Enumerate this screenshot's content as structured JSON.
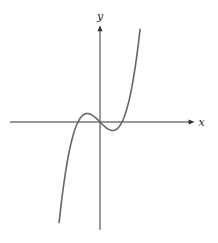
{
  "chart_data": {
    "type": "line",
    "title": "",
    "xlabel": "x",
    "ylabel": "y",
    "function": "y = x^3 - x",
    "xlim": [
      -4.1,
      4.3
    ],
    "ylim": [
      -4.9,
      4.4
    ],
    "grid": false,
    "legend": "none",
    "series": [
      {
        "name": "cubic",
        "x_range": [
          -1.86,
          1.82
        ],
        "x": [
          -1.86,
          -1.5,
          -1.0,
          -0.577,
          0,
          0.577,
          1.0,
          1.5,
          1.82
        ],
        "y": [
          -4.57,
          -1.88,
          0,
          0.385,
          0,
          -0.385,
          0,
          1.88,
          4.21
        ]
      }
    ],
    "annotations": {
      "roots": [
        -1,
        0,
        1
      ],
      "local_max": [
        -0.577,
        0.385
      ],
      "local_min": [
        0.577,
        -0.385
      ]
    },
    "colors": {
      "axis": "#333333",
      "curve": "#666666"
    }
  }
}
